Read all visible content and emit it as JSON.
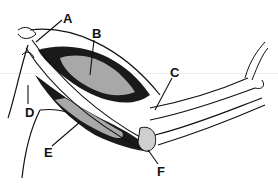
{
  "diagram": {
    "labels": [
      {
        "id": "A",
        "text": "A",
        "x": 63,
        "y": 12
      },
      {
        "id": "B",
        "text": "B",
        "x": 92,
        "y": 27
      },
      {
        "id": "C",
        "text": "C",
        "x": 172,
        "y": 67
      },
      {
        "id": "D",
        "text": "D",
        "x": 25,
        "y": 106
      },
      {
        "id": "E",
        "text": "E",
        "x": 44,
        "y": 146
      },
      {
        "id": "F",
        "text": "F",
        "x": 157,
        "y": 165
      }
    ],
    "colors": {
      "muscle_light": "#a8a8a8",
      "muscle_dark": "#1a1a1a",
      "line": "#111111",
      "background": "#ffffff"
    }
  }
}
